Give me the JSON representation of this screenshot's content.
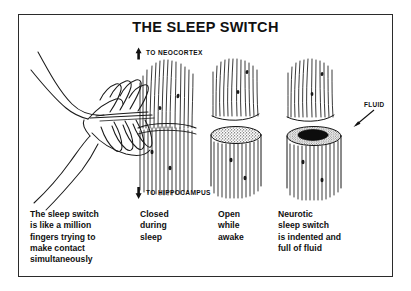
{
  "figure": {
    "title": "THE SLEEP SWITCH",
    "border_color": "#2b2b2b",
    "ink_color": "#111111",
    "background": "#ffffff"
  },
  "pathway_labels": {
    "up_arrow_icon": "arrow-up-icon",
    "neocortex": "TO NEOCORTEX",
    "down_arrow_icon": "arrow-down-icon",
    "hippocampus": "TO HIPPOCAMPUS",
    "fluid": "FLUID",
    "fluid_pointer_icon": "leader-arrow-icon"
  },
  "panels": [
    {
      "id": "hands",
      "illustration": "two-hands-interlocking-fingers",
      "caption": "The sleep switch\nis like a million\nfingers trying to\nmake contact\nsimultaneously"
    },
    {
      "id": "closed",
      "illustration": "fiber-bundle-closed",
      "caption": "Closed\nduring\nsleep"
    },
    {
      "id": "open",
      "illustration": "fiber-bundle-open-gap-stippled-cap",
      "caption": "Open\nwhile\nawake"
    },
    {
      "id": "neurotic",
      "illustration": "fiber-bundle-indented-fluid-filled",
      "caption": "Neurotic\nsleep switch\nis indented and\nfull of fluid"
    }
  ]
}
